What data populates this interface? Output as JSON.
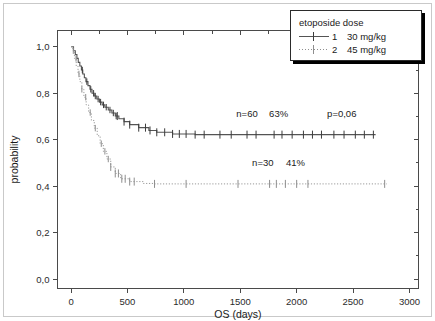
{
  "chart_data": {
    "type": "line",
    "title": "",
    "xlabel": "OS (days)",
    "ylabel": "probability",
    "xlim": [
      -120,
      3080
    ],
    "ylim": [
      -0.04,
      1.07
    ],
    "xticks": [
      0,
      500,
      1000,
      1500,
      2000,
      2500,
      3000
    ],
    "xtick_labels": [
      "0",
      "500",
      "1000",
      "1500",
      "2000",
      "2500",
      "3000"
    ],
    "yticks": [
      0.0,
      0.2,
      0.4,
      0.6,
      0.8,
      1.0
    ],
    "ytick_labels": [
      "0,0",
      "0,2",
      "0,4",
      "0,6",
      "0,8",
      "1,0"
    ],
    "grid": false,
    "legend_position": "top-right",
    "series": [
      {
        "name": "1  30 mg/kg",
        "key": "1",
        "dose": "30 mg/kg",
        "style": "solid",
        "n": 60,
        "survival_pct": "63%",
        "steps": [
          [
            0,
            1.0
          ],
          [
            18,
            1.0
          ],
          [
            22,
            0.983
          ],
          [
            38,
            0.967
          ],
          [
            52,
            0.95
          ],
          [
            64,
            0.933
          ],
          [
            78,
            0.917
          ],
          [
            92,
            0.9
          ],
          [
            104,
            0.883
          ],
          [
            118,
            0.867
          ],
          [
            132,
            0.85
          ],
          [
            150,
            0.833
          ],
          [
            168,
            0.817
          ],
          [
            186,
            0.8
          ],
          [
            205,
            0.788
          ],
          [
            228,
            0.775
          ],
          [
            252,
            0.762
          ],
          [
            276,
            0.75
          ],
          [
            300,
            0.74
          ],
          [
            330,
            0.728
          ],
          [
            362,
            0.715
          ],
          [
            392,
            0.702
          ],
          [
            424,
            0.69
          ],
          [
            470,
            0.678
          ],
          [
            520,
            0.665
          ],
          [
            600,
            0.652
          ],
          [
            690,
            0.64
          ],
          [
            760,
            0.632
          ],
          [
            900,
            0.625
          ],
          [
            1100,
            0.622
          ],
          [
            1500,
            0.622
          ],
          [
            2000,
            0.622
          ],
          [
            2700,
            0.622
          ]
        ],
        "censor_times": [
          410,
          470,
          520,
          600,
          660,
          700,
          760,
          830,
          900,
          960,
          1020,
          1100,
          1180,
          1320,
          1420,
          1560,
          1640,
          1800,
          1870,
          1960,
          2060,
          2140,
          2220,
          2330,
          2420,
          2520,
          2600,
          2680
        ],
        "censor_y": 0.622
      },
      {
        "name": "2  45 mg/kg",
        "key": "2",
        "dose": "45 mg/kg",
        "style": "dotted",
        "n": 30,
        "survival_pct": "41%",
        "steps": [
          [
            0,
            1.0
          ],
          [
            16,
            0.983
          ],
          [
            30,
            0.95
          ],
          [
            46,
            0.917
          ],
          [
            62,
            0.883
          ],
          [
            78,
            0.85
          ],
          [
            96,
            0.817
          ],
          [
            114,
            0.783
          ],
          [
            134,
            0.75
          ],
          [
            156,
            0.717
          ],
          [
            180,
            0.683
          ],
          [
            206,
            0.65
          ],
          [
            232,
            0.617
          ],
          [
            258,
            0.583
          ],
          [
            286,
            0.55
          ],
          [
            318,
            0.517
          ],
          [
            352,
            0.483
          ],
          [
            392,
            0.455
          ],
          [
            440,
            0.432
          ],
          [
            520,
            0.42
          ],
          [
            640,
            0.412
          ],
          [
            740,
            0.41
          ],
          [
            1200,
            0.41
          ],
          [
            1800,
            0.41
          ],
          [
            2400,
            0.41
          ],
          [
            2800,
            0.41
          ]
        ],
        "censor_times": [
          352,
          392,
          420,
          450,
          480,
          520,
          560,
          740,
          1020,
          1480,
          1760,
          1820,
          1900,
          2000,
          2100,
          2780
        ],
        "censor_y": 0.41
      }
    ],
    "annotations": [
      {
        "id": "n-solid",
        "text": "n=60",
        "x": 1560,
        "y": 0.7
      },
      {
        "id": "pct-solid",
        "text": "63%",
        "x": 1840,
        "y": 0.7
      },
      {
        "id": "pvalue",
        "text": "p=0,06",
        "x": 2400,
        "y": 0.7
      },
      {
        "id": "n-dotted",
        "text": "n=30",
        "x": 1700,
        "y": 0.485
      },
      {
        "id": "pct-dotted",
        "text": "41%",
        "x": 1990,
        "y": 0.485
      }
    ]
  },
  "legend": {
    "title": "etoposide dose",
    "entries": [
      {
        "key": "1",
        "label": "30 mg/kg",
        "style": "solid"
      },
      {
        "key": "2",
        "label": "45 mg/kg",
        "style": "dotted"
      }
    ]
  }
}
